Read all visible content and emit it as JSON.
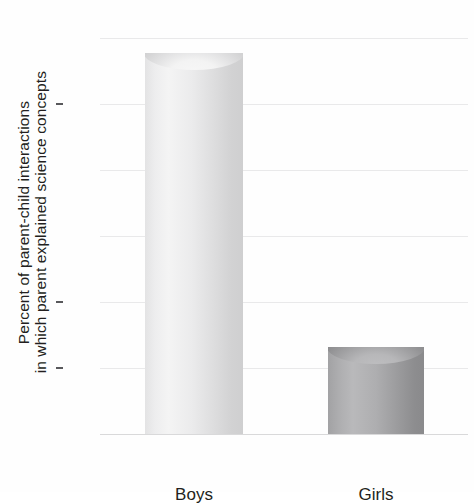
{
  "chart_data": {
    "type": "bar",
    "title": "",
    "subtitle": "",
    "categories": [
      "Boys",
      "Girls"
    ],
    "values": [
      28.9,
      6.6
    ],
    "series": [
      {
        "name": "Percent of parent-child interactions in which parent explained science concepts",
        "values": [
          28.9,
          6.6
        ]
      }
    ],
    "xlabel": "",
    "ylabel_line1": "Percent of parent-child interactions",
    "ylabel_line2": "in which parent explained science concepts",
    "ylim": [
      0,
      30
    ],
    "yticks": [
      0,
      5,
      10,
      15,
      20,
      25,
      30
    ],
    "ytick_labels": [
      "0",
      "5",
      "10",
      "15",
      "20",
      "25",
      "30"
    ],
    "grid": true,
    "grid_axis": "y",
    "legend": false,
    "legend_position": "none",
    "bar_colors": [
      "#e8e8e9",
      "#a8a8aa"
    ],
    "bar_style": "3d-cylinder",
    "background_color": "#ffffff",
    "text_color": "#231f20",
    "gridline_color": "#e9e9ea"
  },
  "axes": {
    "y": {
      "ticks": [
        {
          "label": "30",
          "value": 30,
          "major": false
        },
        {
          "label": "25",
          "value": 25,
          "major": true
        },
        {
          "label": "20",
          "value": 20,
          "major": false
        },
        {
          "label": "15",
          "value": 15,
          "major": false
        },
        {
          "label": "10",
          "value": 10,
          "major": true
        },
        {
          "label": "5",
          "value": 5,
          "major": true
        },
        {
          "label": "0",
          "value": 0,
          "major": false
        }
      ]
    },
    "x": {
      "ticks": [
        {
          "label": "Boys"
        },
        {
          "label": "Girls"
        }
      ]
    }
  }
}
